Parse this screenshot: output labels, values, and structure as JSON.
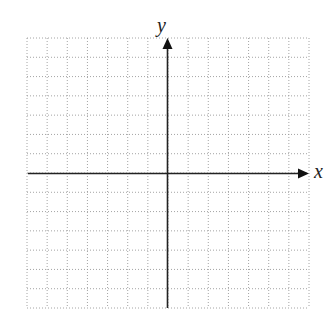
{
  "chart_data": {
    "type": "scatter",
    "title": "",
    "xlabel": "x",
    "ylabel": "y",
    "grid": true,
    "grid_style": "dotted",
    "xlim": [
      -7,
      7
    ],
    "ylim": [
      -7,
      7
    ],
    "x_ticks_count": 14,
    "y_ticks_count": 14,
    "tick_labels": [],
    "series": []
  },
  "colors": {
    "axis": "#222222",
    "grid": "#9a9a9a",
    "background": "#ffffff"
  },
  "labels": {
    "x_axis": "x",
    "y_axis": "y"
  }
}
